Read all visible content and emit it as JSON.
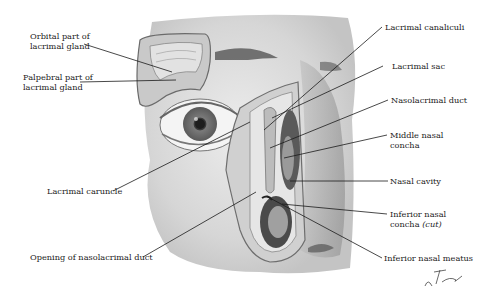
{
  "figure": {
    "signature": "F. Netter"
  },
  "labels": {
    "orbital_part": [
      "Orbital part of",
      "lacrimal gland"
    ],
    "palpebral_part": [
      "Palpebral part of",
      "lacrimal gland"
    ],
    "lacrimal_caruncle": "Lacrimal caruncle",
    "opening_nasolacrimal": "Opening of nasolacrimal duct",
    "lacrimal_canaliculi": "Lacrimal canaliculi",
    "lacrimal_sac": "Lacrimal sac",
    "nasolacrimal_duct": "Nasolacrimal duct",
    "middle_concha": [
      "Middle nasal",
      "concha"
    ],
    "nasal_cavity": "Nasal cavity",
    "inferior_concha": [
      "Inferior nasal",
      "concha"
    ],
    "inferior_concha_note": "(cut)",
    "inferior_meatus": "Inferior nasal meatus"
  },
  "colors": {
    "skin": "#d9d9d9",
    "skin_dark": "#a8a8a8",
    "iris": "#6f6f6f",
    "leader": "#1a1a1a"
  }
}
